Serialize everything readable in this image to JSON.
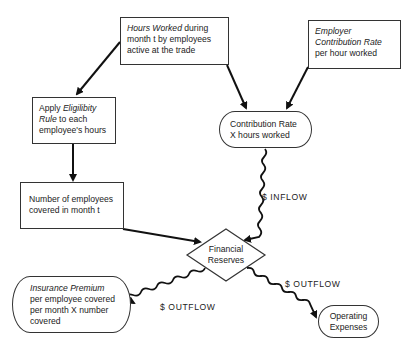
{
  "nodes": {
    "hours_worked": {
      "italic": "Hours Worked",
      "rest_line1": " during",
      "line2": "month t by employees",
      "line3": "active at the trade"
    },
    "employer_rate": {
      "line1": "Employer",
      "line2": "Contribution Rate",
      "line3": "per hour worked"
    },
    "apply_rule": {
      "line1_plain": "Apply ",
      "line1_italic": "Eligilibity",
      "line2_italic": "Rule",
      "line2_plain": " to each",
      "line3": "employee's hours"
    },
    "contribution": {
      "line1": "Contribution Rate",
      "line2": "X hours worked"
    },
    "number_covered": {
      "line1": "Number of employees",
      "line2": "covered in month t"
    },
    "financial_reserves": {
      "line1": "Financial",
      "line2": "Reserves"
    },
    "insurance_premium": {
      "line1": "Insurance Premium",
      "line2": "per employee covered",
      "line3": "per month  X number",
      "line4": "covered"
    },
    "operating_expenses": {
      "line1": "Operating",
      "line2": "Expenses"
    }
  },
  "flow_labels": {
    "inflow": "$ INFLOW",
    "outflow_left": "$ OUTFLOW",
    "outflow_right": "$ OUTFLOW"
  }
}
